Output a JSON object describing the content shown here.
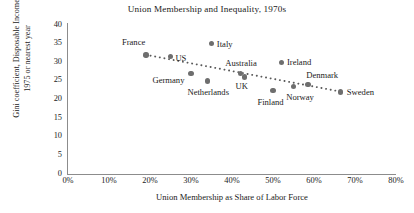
{
  "chart_data": {
    "type": "scatter",
    "title": "Union Membership and Inequality, 1970s",
    "xlabel": "Union Membership as Share of Labor Force",
    "ylabel": "Gini coefficient, Disposable Income\n1975 or nearest year",
    "xlim": [
      0,
      80
    ],
    "ylim": [
      0,
      40
    ],
    "xticks": [
      "0%",
      "10%",
      "20%",
      "30%",
      "40%",
      "50%",
      "60%",
      "70%",
      "80%"
    ],
    "xtick_values": [
      0,
      10,
      20,
      30,
      40,
      50,
      60,
      70,
      80
    ],
    "yticks": [
      "0",
      "5",
      "10",
      "15",
      "20",
      "25",
      "30",
      "35",
      "40"
    ],
    "ytick_values": [
      0,
      5,
      10,
      15,
      20,
      25,
      30,
      35,
      40
    ],
    "grid": false,
    "legend": "none",
    "marker_color": "#6e6e6e",
    "axis_color": "#8c8c8c",
    "trendline": {
      "type": "dotted-linear",
      "color": "#5a5a5a",
      "x_start": 19,
      "y_start": 32,
      "x_end": 67,
      "y_end": 22
    },
    "points": [
      {
        "label": "France",
        "x": 19.0,
        "y": 32.0,
        "label_x": 16.0,
        "label_y": 35.5,
        "anchor": "center"
      },
      {
        "label": "US",
        "x": 25.0,
        "y": 31.5,
        "label_x": 26.2,
        "label_y": 31.2,
        "anchor": "right"
      },
      {
        "label": "Italy",
        "x": 35.0,
        "y": 35.0,
        "label_x": 36.3,
        "label_y": 35.0,
        "anchor": "right"
      },
      {
        "label": "Germany",
        "x": 30.0,
        "y": 27.0,
        "label_x": 28.4,
        "label_y": 25.3,
        "anchor": "left"
      },
      {
        "label": "Netherlands",
        "x": 34.0,
        "y": 25.0,
        "label_x": 34.2,
        "label_y": 22.0,
        "anchor": "center"
      },
      {
        "label": "Australia",
        "x": 42.0,
        "y": 27.0,
        "label_x": 42.2,
        "label_y": 29.8,
        "anchor": "center"
      },
      {
        "label": "UK",
        "x": 43.0,
        "y": 26.0,
        "label_x": 42.4,
        "label_y": 23.6,
        "anchor": "center"
      },
      {
        "label": "Ireland",
        "x": 52.0,
        "y": 30.0,
        "label_x": 53.4,
        "label_y": 30.0,
        "anchor": "right"
      },
      {
        "label": "Finland",
        "x": 50.0,
        "y": 22.5,
        "label_x": 49.4,
        "label_y": 19.2,
        "anchor": "center"
      },
      {
        "label": "Norway",
        "x": 55.0,
        "y": 23.5,
        "label_x": 56.6,
        "label_y": 20.8,
        "anchor": "center"
      },
      {
        "label": "Denmark",
        "x": 58.5,
        "y": 24.0,
        "label_x": 62.0,
        "label_y": 26.5,
        "anchor": "center"
      },
      {
        "label": "Sweden",
        "x": 66.5,
        "y": 22.0,
        "label_x": 68.0,
        "label_y": 22.0,
        "anchor": "right"
      }
    ]
  }
}
